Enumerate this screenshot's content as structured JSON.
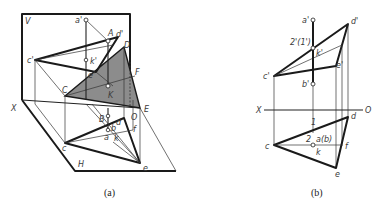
{
  "figure": {
    "panels": [
      {
        "id": "a",
        "caption": "(a)",
        "type": "axonometric projection",
        "plane_labels": {
          "vertical": "V",
          "horizontal": "H",
          "axis": "X"
        },
        "labels": {
          "a_prime": "a'",
          "A": "A",
          "d_prime": "d'",
          "D": "D",
          "c_prime": "c'",
          "k_prime": "k'",
          "e_prime": "e'",
          "F": "F",
          "C": "C",
          "K": "K",
          "E": "E",
          "B": "B",
          "O": "O",
          "d": "d",
          "b": "b",
          "a": "a",
          "f": "f",
          "c": "c",
          "k": "k",
          "e": "e"
        }
      },
      {
        "id": "b",
        "caption": "(b)",
        "type": "orthographic projection",
        "axis_labels": {
          "left": "X",
          "right": "O"
        },
        "labels": {
          "a_prime": "a'",
          "d_prime": "d'",
          "two_one_prime": "2'(1')",
          "k_prime": "k'",
          "e_prime": "e'",
          "c_prime": "c'",
          "b_prime": "b'",
          "d": "d",
          "one": "1",
          "two": "2",
          "a_b": "a(b)",
          "c": "c",
          "k": "k",
          "f": "f",
          "e": "e"
        }
      }
    ],
    "colors": {
      "plane_fill": "#8c8c8c",
      "line": "#1a1a1a",
      "background": "#ffffff"
    }
  }
}
